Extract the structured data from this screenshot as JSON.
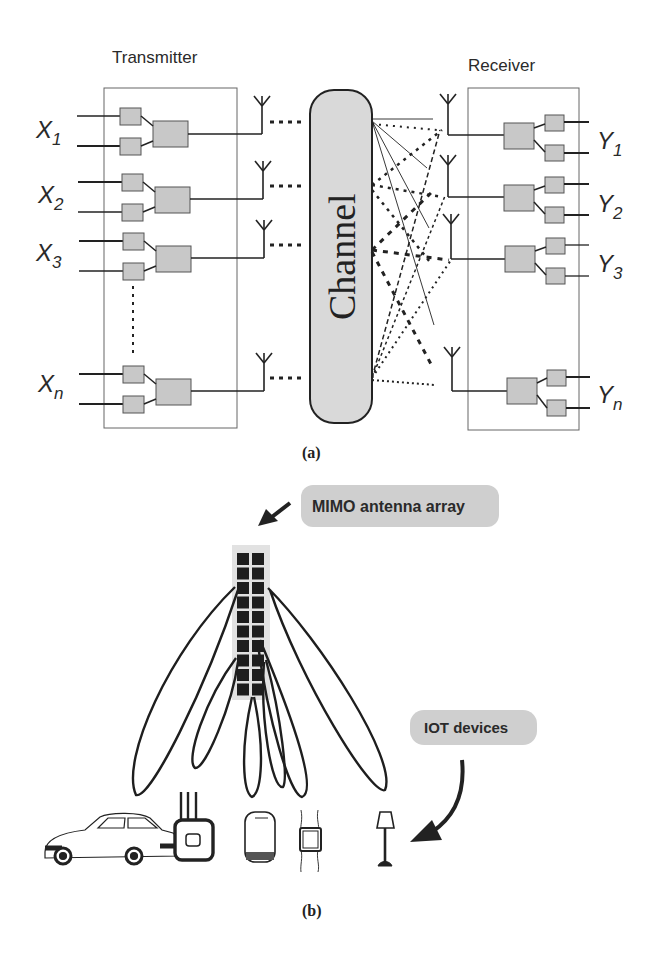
{
  "figure_a": {
    "caption": "(a)",
    "transmitter_label": "Transmitter",
    "receiver_label": "Receiver",
    "channel_label": "Channel",
    "inputs": [
      {
        "base": "X",
        "sub": "1"
      },
      {
        "base": "X",
        "sub": "2"
      },
      {
        "base": "X",
        "sub": "3"
      },
      {
        "base": "X",
        "sub": "n"
      }
    ],
    "outputs": [
      {
        "base": "Y",
        "sub": "1"
      },
      {
        "base": "Y",
        "sub": "2"
      },
      {
        "base": "Y",
        "sub": "3"
      },
      {
        "base": "Y",
        "sub": "n"
      }
    ]
  },
  "figure_b": {
    "caption": "(b)",
    "array_label": "MIMO antenna array",
    "devices_label": "IOT devices",
    "array_grid": {
      "columns": 2,
      "rows": 10
    },
    "devices": [
      "car",
      "router",
      "smartphone",
      "smartwatch",
      "floor-lamp"
    ]
  },
  "colors": {
    "block_fill": "#c8c8c8",
    "block_stroke": "#555555",
    "channel_fill": "#d9d9d9",
    "label_pill": "#cfcfcf",
    "ink": "#222222"
  }
}
